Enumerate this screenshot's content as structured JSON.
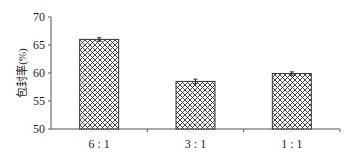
{
  "chart_data": {
    "type": "bar",
    "title": "",
    "xlabel": "",
    "ylabel": "包封率(%)",
    "categories": [
      "6 : 1",
      "3 : 1",
      "1 : 1"
    ],
    "values": [
      66.0,
      58.5,
      59.9
    ],
    "error": [
      0.3,
      0.4,
      0.3
    ],
    "ylim": [
      50,
      70
    ],
    "yticks": [
      50,
      55,
      60,
      65,
      70
    ],
    "grid": false,
    "legend": null,
    "bar_fill": "crosshatch",
    "bar_color": "#333333"
  }
}
